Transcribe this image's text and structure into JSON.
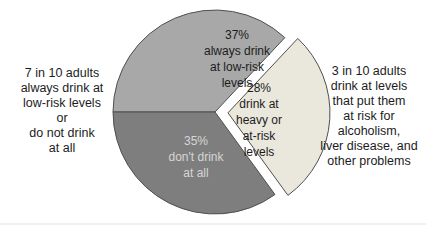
{
  "chart_data": {
    "type": "pie",
    "title": "",
    "start_angle_deg": 180,
    "direction": "clockwise",
    "outline_color": "#4f4f4f",
    "slices": [
      {
        "label": "37%\nalways drink\nat low-risk\nlevels",
        "value": 37,
        "color": "#a8a8a8",
        "label_color": "#1c1c1c",
        "explode_px": 0
      },
      {
        "label": "28%\ndrink at\nheavy or\nat-risk\nlevels",
        "value": 28,
        "color": "#eae7dc",
        "label_color": "#1c1c1c",
        "explode_px": 13
      },
      {
        "label": "35%\ndon't drink\nat all",
        "value": 35,
        "color": "#7e7e7e",
        "label_color": "#d6d6d6",
        "explode_px": 0
      }
    ],
    "annotations": {
      "left": "7 in 10 adults\nalways drink at\nlow-risk levels\nor\ndo not drink\nat all",
      "right": "3 in 10 adults\ndrink at levels\nthat put them\nat risk for\nalcoholism,\nliver disease, and\nother problems"
    }
  }
}
